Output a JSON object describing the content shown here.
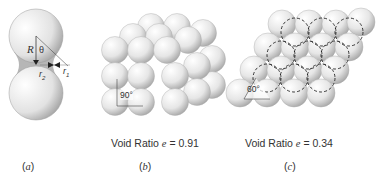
{
  "figure": {
    "panels": [
      {
        "id": "a",
        "caption": "(a)",
        "caption_letter": "a",
        "description": "Two spheres in contact with liquid bridge",
        "labels": {
          "radius": "R",
          "angle": "θ",
          "r1": "r",
          "r1_sub": "1",
          "r2": "r",
          "r2_sub": "2"
        }
      },
      {
        "id": "b",
        "caption": "(b)",
        "caption_letter": "b",
        "packing": "simple cubic",
        "angle_label": "90°",
        "void_ratio_label": "Void Ratio",
        "void_symbol": "e",
        "void_value": "= 0.91"
      },
      {
        "id": "c",
        "caption": "(c)",
        "caption_letter": "c",
        "packing": "rhombohedral",
        "angle_label": "60°",
        "void_ratio_label": "Void Ratio",
        "void_symbol": "e",
        "void_value": "= 0.34"
      }
    ]
  },
  "colors": {
    "sphere_light": "#ffffff",
    "sphere_dark": "#9a9a9a",
    "outline": "#8a8a8a",
    "line": "#333333"
  }
}
